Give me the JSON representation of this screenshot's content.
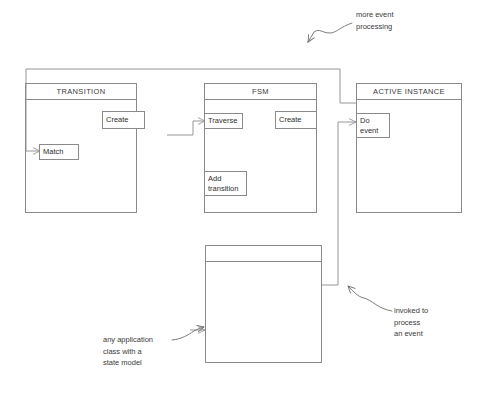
{
  "diagram": {
    "background_color": "#ffffff",
    "line_color": "#8a8a8a",
    "text_color": "#3a3a3a"
  },
  "classes": [
    {
      "id": "transition",
      "title": "TRANSITION",
      "methods": [
        {
          "id": "create",
          "lines": [
            "Create"
          ]
        },
        {
          "id": "match",
          "lines": [
            "Match"
          ]
        }
      ]
    },
    {
      "id": "fsm",
      "title": "FSM",
      "methods": [
        {
          "id": "traverse",
          "lines": [
            "Traverse"
          ]
        },
        {
          "id": "create",
          "lines": [
            "Create"
          ]
        },
        {
          "id": "add-transition",
          "lines": [
            "Add",
            "transition"
          ]
        }
      ]
    },
    {
      "id": "active-instance",
      "title": "ACTIVE INSTANCE",
      "methods": [
        {
          "id": "do-event",
          "lines": [
            "Do",
            "event"
          ]
        }
      ]
    },
    {
      "id": "application-class",
      "title": "",
      "methods": []
    }
  ],
  "annotations": [
    {
      "id": "more-event-processing",
      "lines": [
        "more event",
        "processing"
      ]
    },
    {
      "id": "invoked-to-process-an-event",
      "lines": [
        "invoked to",
        "process",
        "an event"
      ]
    },
    {
      "id": "any-application-class",
      "lines": [
        "any application",
        "class with a",
        "state model"
      ]
    }
  ]
}
